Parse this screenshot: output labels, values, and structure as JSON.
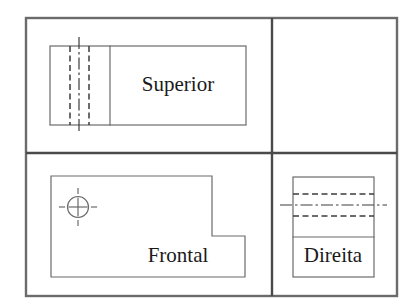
{
  "drawing": {
    "title": "Orthographic Projection Views",
    "description": "Technical multiview drawing showing three orthographic projections of an L-shaped part",
    "canvas": {
      "width": 418,
      "height": 306
    },
    "colors": {
      "background": "#ffffff",
      "frame_stroke": "#4a4a4a",
      "object_stroke": "#6b6b6b",
      "hidden_line": "#3d3d3d",
      "center_line": "#3d3d3d",
      "text": "#1a1a1a"
    },
    "frame": {
      "outer": {
        "x": 26,
        "y": 18,
        "width": 371,
        "height": 278
      },
      "divider_horizontal_y": 153,
      "divider_vertical_x": 272,
      "stroke_width": 2.4
    },
    "views": [
      {
        "name": "superior",
        "label": "Superior",
        "label_x": 178,
        "label_y": 86,
        "font_size": 21,
        "outline": {
          "x": 50,
          "y": 46,
          "width": 196,
          "height": 79
        },
        "solid_division_x": 110,
        "hidden_lines_x": [
          70,
          89
        ],
        "center_line_x": 79,
        "center_line_overhang": 9
      },
      {
        "name": "frontal",
        "label": "Frontal",
        "label_x": 178,
        "label_y": 257,
        "font_size": 21,
        "l_shape_points": "51,176 212,176 212,236 245,236 245,277 51,277",
        "l_shape_corner_x": 212,
        "l_shape_corner_y": 236,
        "circle": {
          "cx": 78,
          "cy": 207,
          "r": 10.5,
          "crosshair_length": 9,
          "center_mark_overhang": 8
        }
      },
      {
        "name": "direita",
        "label": "Direita",
        "label_x": 333,
        "label_y": 257,
        "font_size": 21,
        "outline": {
          "x": 293,
          "y": 177,
          "width": 81,
          "height": 100
        },
        "solid_division_y": 237,
        "hidden_lines_y": [
          194,
          216
        ],
        "center_line_y": 205,
        "center_line_overhang": 13
      }
    ],
    "line_styles": {
      "hidden_dash": "6,3.5",
      "center_dash": "12,3,2.5,3",
      "object_stroke_width": 1.2,
      "hidden_stroke_width": 1.5,
      "center_stroke_width": 1.2
    }
  }
}
